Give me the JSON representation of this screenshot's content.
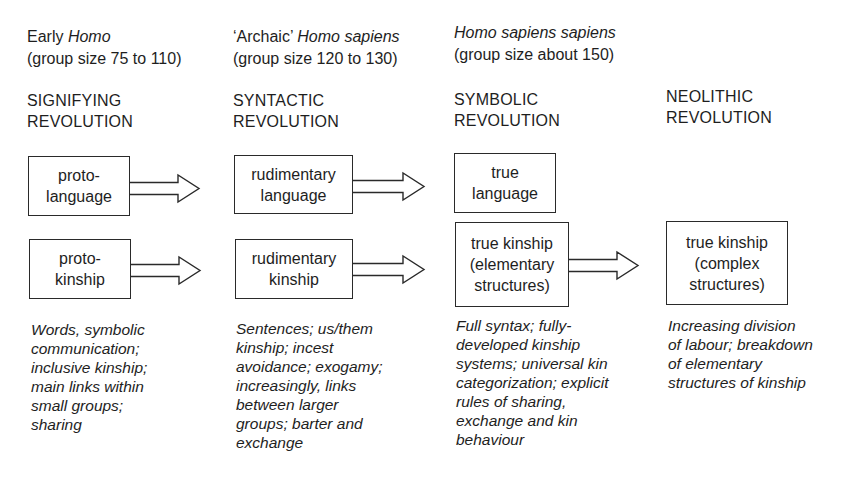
{
  "columns": [
    {
      "species_prefix": "Early ",
      "species_italic": "Homo",
      "group_size": "(group size 75 to 110)",
      "revolution_line1": "SIGNIFYING",
      "revolution_line2": "REVOLUTION",
      "language_box": [
        "proto-",
        "language"
      ],
      "kinship_box": [
        "proto-",
        "kinship"
      ],
      "description": [
        "Words, symbolic",
        "communication;",
        "inclusive kinship;",
        "main links within",
        "small groups;",
        "sharing"
      ]
    },
    {
      "species_prefix": "‘Archaic’ ",
      "species_italic": "Homo sapiens",
      "group_size": "(group size 120 to 130)",
      "revolution_line1": "SYNTACTIC",
      "revolution_line2": "REVOLUTION",
      "language_box": [
        "rudimentary",
        "language"
      ],
      "kinship_box": [
        "rudimentary",
        "kinship"
      ],
      "description": [
        "Sentences; us/them",
        "kinship; incest",
        "avoidance; exogamy;",
        "increasingly, links",
        "between larger",
        "groups; barter and",
        "exchange"
      ]
    },
    {
      "species_prefix": "",
      "species_italic": "Homo sapiens sapiens",
      "group_size": "(group size about 150)",
      "revolution_line1": "SYMBOLIC",
      "revolution_line2": "REVOLUTION",
      "language_box": [
        "true",
        "language"
      ],
      "kinship_box": [
        "true kinship",
        "(elementary",
        "structures)"
      ],
      "description": [
        "Full syntax; fully-",
        "developed kinship",
        "systems; universal kin",
        "categorization; explicit",
        "rules of sharing,",
        "exchange and kin",
        "behaviour"
      ]
    },
    {
      "species_prefix": "",
      "species_italic": "",
      "group_size": "",
      "revolution_line1": "NEOLITHIC",
      "revolution_line2": "REVOLUTION",
      "kinship_box": [
        "true kinship",
        "(complex",
        "structures)"
      ],
      "description": [
        "Increasing division",
        "of labour; breakdown",
        "of elementary",
        "structures of kinship"
      ]
    }
  ],
  "arrows": [
    {
      "from": "proto-language",
      "to": "rudimentary language"
    },
    {
      "from": "rudimentary language",
      "to": "true language"
    },
    {
      "from": "proto-kinship",
      "to": "rudimentary kinship"
    },
    {
      "from": "rudimentary kinship",
      "to": "true kinship (elementary structures)"
    },
    {
      "from": "true kinship (elementary structures)",
      "to": "true kinship (complex structures)"
    }
  ],
  "colors": {
    "ink": "#1e1e1e",
    "background": "#ffffff"
  }
}
